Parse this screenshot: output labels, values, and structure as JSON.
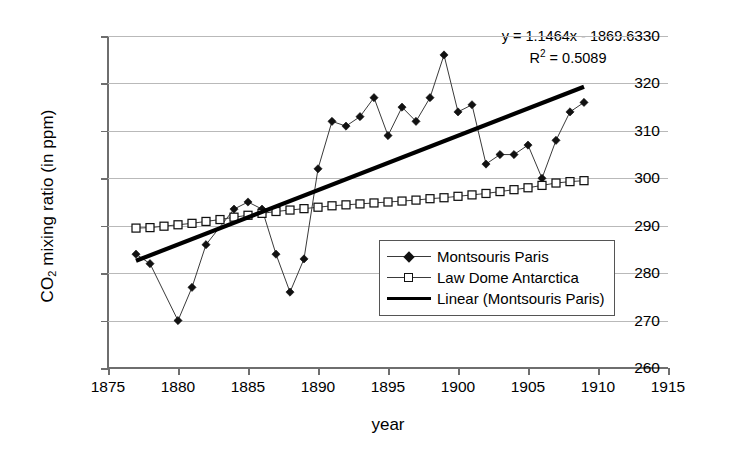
{
  "chart_data": {
    "type": "line",
    "title": "",
    "xlabel": "year",
    "ylabel_html": "CO2 mixing ratio (in ppm)",
    "ylabel_main": "mixing ratio (in ppm)",
    "ylabel_prefix": "CO",
    "ylabel_sub": "2",
    "xlim": [
      1875,
      1915
    ],
    "ylim": [
      260,
      330
    ],
    "xticks": [
      1875,
      1880,
      1885,
      1890,
      1895,
      1900,
      1905,
      1910,
      1915
    ],
    "yticks": [
      260,
      270,
      280,
      290,
      300,
      310,
      320,
      330
    ],
    "grid": "horizontal",
    "legend_position": "inside-center-right",
    "annotations": {
      "equation": "y = 1.1464x - 1869.6",
      "r_squared_prefix": "R",
      "r_squared_sup": "2",
      "r_squared_value": " = 0.5089"
    },
    "series": [
      {
        "name": "Montsouris Paris",
        "marker": "filled-diamond",
        "x": [
          1877,
          1878,
          1880,
          1881,
          1882,
          1884,
          1885,
          1886,
          1887,
          1888,
          1889,
          1890,
          1891,
          1892,
          1893,
          1894,
          1895,
          1896,
          1897,
          1898,
          1899,
          1900,
          1901,
          1902,
          1903,
          1904,
          1905,
          1906,
          1907,
          1908,
          1909
        ],
        "values": [
          284,
          282,
          270,
          277,
          286,
          293.5,
          295,
          293.5,
          284,
          276,
          283,
          302,
          312,
          311,
          313,
          317,
          309,
          315,
          312,
          317,
          326,
          314,
          315.5,
          303,
          305,
          305,
          307,
          300,
          308,
          314,
          316
        ]
      },
      {
        "name": "Law Dome Antarctica",
        "marker": "open-square",
        "x": [
          1877,
          1878,
          1879,
          1880,
          1881,
          1882,
          1883,
          1884,
          1885,
          1886,
          1887,
          1888,
          1889,
          1890,
          1891,
          1892,
          1893,
          1894,
          1895,
          1896,
          1897,
          1898,
          1899,
          1900,
          1901,
          1902,
          1903,
          1904,
          1905,
          1906,
          1907,
          1908,
          1909
        ],
        "values": [
          289.5,
          289.6,
          289.9,
          290.2,
          290.5,
          290.9,
          291.3,
          291.8,
          292.2,
          292.6,
          293.0,
          293.3,
          293.6,
          293.9,
          294.2,
          294.4,
          294.6,
          294.8,
          295.0,
          295.2,
          295.4,
          295.7,
          295.9,
          296.2,
          296.5,
          296.8,
          297.2,
          297.6,
          298.0,
          298.5,
          299.0,
          299.3,
          299.5
        ]
      },
      {
        "name": "Linear (Montsouris Paris)",
        "marker": "none",
        "type": "trendline",
        "x": [
          1877,
          1909
        ],
        "values": [
          282.6,
          319.3
        ]
      }
    ]
  },
  "legend": {
    "items": [
      {
        "label": "Montsouris Paris",
        "key": "diamond-line"
      },
      {
        "label": "Law Dome Antarctica",
        "key": "square-line"
      },
      {
        "label": "Linear (Montsouris Paris)",
        "key": "thick-line"
      }
    ]
  }
}
